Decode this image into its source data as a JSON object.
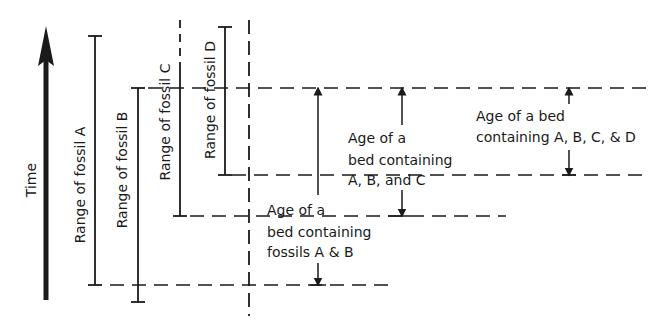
{
  "diagram": {
    "axis": {
      "label": "Time",
      "direction": "up"
    },
    "ranges": [
      {
        "id": "A",
        "label": "Range of fossil A"
      },
      {
        "id": "B",
        "label": "Range of fossil B"
      },
      {
        "id": "C",
        "label": "Range of fossil C"
      },
      {
        "id": "D",
        "label": "Range of fossil D"
      }
    ],
    "annotations": {
      "ab": {
        "line1": "Age of a",
        "line2": "bed containing",
        "line3": "fossils A & B"
      },
      "abc": {
        "line1": "Age of a",
        "line2": "bed containing",
        "line3": "A, B, and C"
      },
      "abcd": {
        "line1": "Age of a bed",
        "line2": "containing A, B, C, & D"
      }
    },
    "colors": {
      "ink": "#1a1a1a",
      "background": "#ffffff"
    }
  }
}
